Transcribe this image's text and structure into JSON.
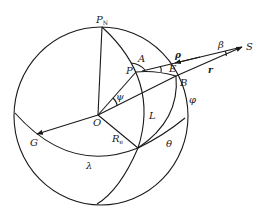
{
  "diagram": {
    "type": "spherical-geometry",
    "labels": {
      "north_pole": "P",
      "north_pole_sub": "N",
      "sub_satellite_point": "P",
      "azimuth": "A",
      "rho": "ρ",
      "beta": "β",
      "satellite": "S",
      "station": "E",
      "r": "r",
      "ground_point": "B",
      "phi": "φ",
      "psi": "ψ",
      "center": "O",
      "L": "L",
      "radius": "R",
      "radius_sub": "e",
      "greenwich": "G",
      "theta": "θ",
      "lambda": "λ"
    },
    "colors": {
      "stroke": "#1a1a1a",
      "background": "#ffffff"
    }
  }
}
